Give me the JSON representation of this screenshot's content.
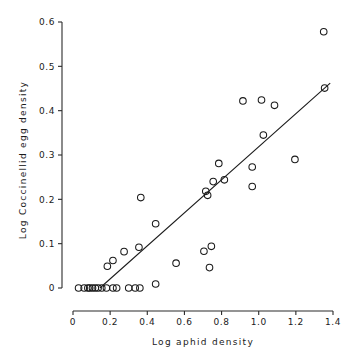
{
  "chart_data": {
    "type": "scatter",
    "title": "",
    "xlabel": "Log aphid density",
    "ylabel": "Log Coccinellid egg density",
    "xlim": [
      0,
      1.4
    ],
    "ylim": [
      0,
      0.6
    ],
    "grid": false,
    "legend": null,
    "x_ticks": [
      0,
      0.2,
      0.4,
      0.6,
      0.8,
      1.0,
      1.2,
      1.4
    ],
    "x_tick_labels": [
      "0",
      "0.2",
      "0.4",
      "0.6",
      "0.8",
      "1.0",
      "1.2",
      "1.4"
    ],
    "y_ticks": [
      0,
      0.1,
      0.2,
      0.3,
      0.4,
      0.5,
      0.6
    ],
    "y_tick_labels": [
      "0",
      "0.1",
      "0.2",
      "0.3",
      "0.4",
      "0.5",
      "0.6"
    ],
    "marker": "open-circle",
    "marker_color": "#1a1a1a",
    "points": [
      {
        "x": 0.03,
        "y": 0.0
      },
      {
        "x": 0.06,
        "y": 0.0
      },
      {
        "x": 0.08,
        "y": 0.0
      },
      {
        "x": 0.09,
        "y": 0.0
      },
      {
        "x": 0.105,
        "y": 0.0
      },
      {
        "x": 0.12,
        "y": 0.0
      },
      {
        "x": 0.135,
        "y": 0.0
      },
      {
        "x": 0.155,
        "y": 0.0
      },
      {
        "x": 0.18,
        "y": 0.0
      },
      {
        "x": 0.215,
        "y": 0.0
      },
      {
        "x": 0.235,
        "y": 0.0
      },
      {
        "x": 0.3,
        "y": 0.0
      },
      {
        "x": 0.335,
        "y": 0.0
      },
      {
        "x": 0.36,
        "y": 0.0
      },
      {
        "x": 0.445,
        "y": 0.009
      },
      {
        "x": 0.185,
        "y": 0.049
      },
      {
        "x": 0.215,
        "y": 0.062
      },
      {
        "x": 0.275,
        "y": 0.082
      },
      {
        "x": 0.355,
        "y": 0.092
      },
      {
        "x": 0.365,
        "y": 0.204
      },
      {
        "x": 0.445,
        "y": 0.145
      },
      {
        "x": 0.555,
        "y": 0.056
      },
      {
        "x": 0.705,
        "y": 0.083
      },
      {
        "x": 0.735,
        "y": 0.046
      },
      {
        "x": 0.745,
        "y": 0.094
      },
      {
        "x": 0.715,
        "y": 0.218
      },
      {
        "x": 0.725,
        "y": 0.209
      },
      {
        "x": 0.755,
        "y": 0.24
      },
      {
        "x": 0.785,
        "y": 0.281
      },
      {
        "x": 0.815,
        "y": 0.244
      },
      {
        "x": 0.915,
        "y": 0.422
      },
      {
        "x": 0.965,
        "y": 0.229
      },
      {
        "x": 0.965,
        "y": 0.273
      },
      {
        "x": 1.015,
        "y": 0.424
      },
      {
        "x": 1.025,
        "y": 0.345
      },
      {
        "x": 1.085,
        "y": 0.412
      },
      {
        "x": 1.195,
        "y": 0.29
      },
      {
        "x": 1.355,
        "y": 0.451
      },
      {
        "x": 1.35,
        "y": 0.578
      }
    ],
    "fit_line": {
      "label": "regression line",
      "x1": 0.145,
      "y1": 0.0,
      "x2": 1.385,
      "y2": 0.462
    }
  }
}
